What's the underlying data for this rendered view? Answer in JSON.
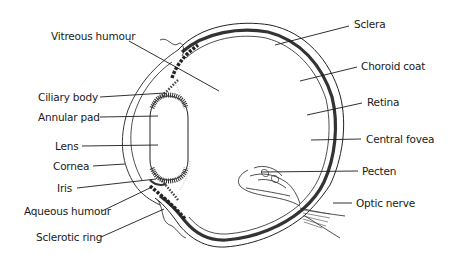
{
  "diagram": {
    "labels_left": [
      {
        "id": "vitreous-humour",
        "text": "Vitreous humour"
      },
      {
        "id": "ciliary-body",
        "text": "Ciliary body"
      },
      {
        "id": "annular-pad",
        "text": "Annular pad"
      },
      {
        "id": "lens",
        "text": "Lens"
      },
      {
        "id": "cornea",
        "text": "Cornea"
      },
      {
        "id": "iris",
        "text": "Iris"
      },
      {
        "id": "aqueous-humour",
        "text": "Aqueous humour"
      },
      {
        "id": "sclerotic-ring",
        "text": "Sclerotic ring"
      }
    ],
    "labels_right": [
      {
        "id": "sclera",
        "text": "Sclera"
      },
      {
        "id": "choroid-coat",
        "text": "Choroid coat"
      },
      {
        "id": "retina",
        "text": "Retina"
      },
      {
        "id": "central-fovea",
        "text": "Central fovea"
      },
      {
        "id": "pecten",
        "text": "Pecten"
      },
      {
        "id": "optic-nerve",
        "text": "Optic nerve"
      }
    ],
    "colors": {
      "ink": "#1a1a1a",
      "background": "#ffffff",
      "choroid": "#333333"
    }
  }
}
